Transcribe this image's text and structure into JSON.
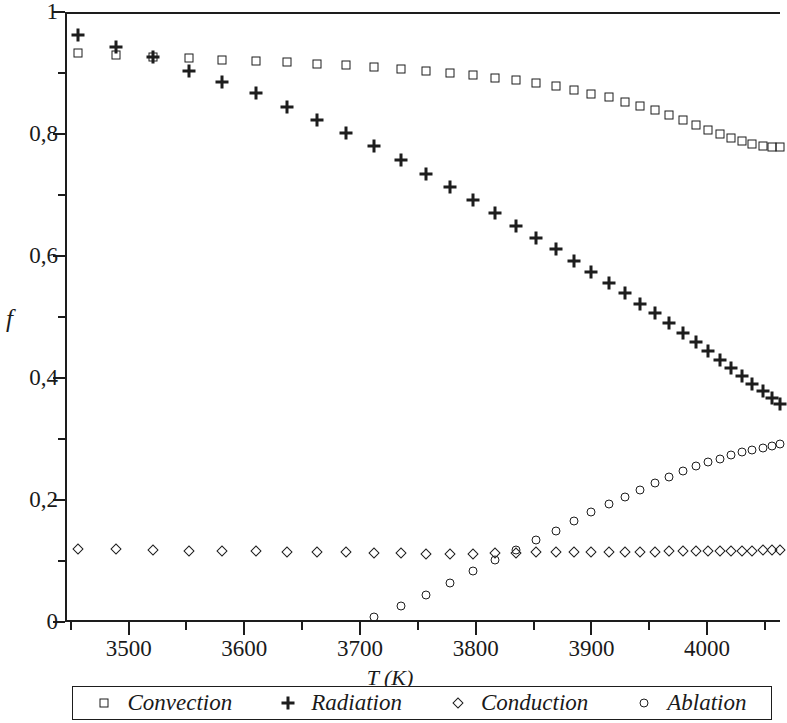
{
  "axes": {
    "y_title": "f",
    "x_title": "T (K)",
    "y_major_labels": [
      "1",
      "0,8",
      "0,6",
      "0,4",
      "0,2",
      "0"
    ],
    "y_major_values": [
      1,
      0.8,
      0.6,
      0.4,
      0.2,
      0
    ],
    "y_minor_values": [
      0.9,
      0.7,
      0.5,
      0.3,
      0.1
    ],
    "x_major_labels": [
      "3500",
      "3600",
      "3700",
      "3800",
      "3900",
      "4000"
    ],
    "x_major_values": [
      3500,
      3600,
      3700,
      3800,
      3900,
      4000
    ],
    "x_minor_values": [
      3450,
      3550,
      3650,
      3750,
      3850,
      3950,
      4050
    ]
  },
  "legend": {
    "items": [
      {
        "label": "Convection",
        "marker": "square-icon"
      },
      {
        "label": "Radiation",
        "marker": "plus-icon"
      },
      {
        "label": "Conduction",
        "marker": "diamond-icon"
      },
      {
        "label": "Ablation",
        "marker": "circle-icon"
      }
    ]
  },
  "chart_data": {
    "type": "scatter",
    "title": "",
    "xlabel": "T (K)",
    "ylabel": "f",
    "xlim": [
      3445,
      4063
    ],
    "ylim": [
      0,
      1
    ],
    "grid": false,
    "legend_position": "bottom",
    "marker_colors": {
      "all": "#1d1d1d"
    },
    "series": [
      {
        "name": "Convection",
        "marker": "square",
        "x": [
          3456,
          3489,
          3521,
          3552,
          3581,
          3610,
          3637,
          3663,
          3688,
          3712,
          3735,
          3757,
          3778,
          3798,
          3817,
          3835,
          3852,
          3869,
          3885,
          3900,
          3915,
          3929,
          3942,
          3955,
          3967,
          3979,
          3990,
          4001,
          4011,
          4021,
          4030,
          4039,
          4048,
          4056,
          4063
        ],
        "y": [
          0.932,
          0.929,
          0.927,
          0.924,
          0.922,
          0.92,
          0.918,
          0.915,
          0.913,
          0.91,
          0.907,
          0.904,
          0.9,
          0.896,
          0.892,
          0.888,
          0.883,
          0.878,
          0.872,
          0.866,
          0.86,
          0.853,
          0.846,
          0.839,
          0.831,
          0.823,
          0.815,
          0.807,
          0.8,
          0.793,
          0.788,
          0.784,
          0.781,
          0.779,
          0.778
        ]
      },
      {
        "name": "Radiation",
        "marker": "plus",
        "x": [
          3456,
          3489,
          3521,
          3552,
          3581,
          3610,
          3637,
          3663,
          3688,
          3712,
          3735,
          3757,
          3778,
          3798,
          3817,
          3835,
          3852,
          3869,
          3885,
          3900,
          3915,
          3929,
          3942,
          3955,
          3967,
          3979,
          3990,
          4001,
          4011,
          4021,
          4030,
          4039,
          4048,
          4056,
          4063
        ],
        "y": [
          0.963,
          0.942,
          0.926,
          0.904,
          0.885,
          0.867,
          0.845,
          0.823,
          0.801,
          0.78,
          0.757,
          0.735,
          0.713,
          0.691,
          0.67,
          0.65,
          0.63,
          0.611,
          0.592,
          0.574,
          0.556,
          0.539,
          0.522,
          0.506,
          0.49,
          0.474,
          0.459,
          0.444,
          0.43,
          0.416,
          0.403,
          0.39,
          0.378,
          0.367,
          0.357
        ]
      },
      {
        "name": "Conduction",
        "marker": "diamond",
        "x": [
          3456,
          3489,
          3521,
          3552,
          3581,
          3610,
          3637,
          3663,
          3688,
          3712,
          3735,
          3757,
          3778,
          3798,
          3817,
          3835,
          3852,
          3869,
          3885,
          3900,
          3915,
          3929,
          3942,
          3955,
          3967,
          3979,
          3990,
          4001,
          4011,
          4021,
          4030,
          4039,
          4048,
          4056,
          4063
        ],
        "y": [
          0.119,
          0.119,
          0.118,
          0.117,
          0.116,
          0.116,
          0.115,
          0.114,
          0.114,
          0.113,
          0.113,
          0.112,
          0.112,
          0.112,
          0.113,
          0.113,
          0.114,
          0.114,
          0.114,
          0.115,
          0.115,
          0.115,
          0.115,
          0.115,
          0.116,
          0.116,
          0.116,
          0.116,
          0.117,
          0.117,
          0.117,
          0.117,
          0.118,
          0.118,
          0.118
        ]
      },
      {
        "name": "Ablation",
        "marker": "circle",
        "x": [
          3712,
          3735,
          3757,
          3778,
          3798,
          3817,
          3835,
          3852,
          3869,
          3885,
          3900,
          3915,
          3929,
          3942,
          3955,
          3967,
          3979,
          3990,
          4001,
          4011,
          4021,
          4030,
          4039,
          4048,
          4056,
          4063
        ],
        "y": [
          0.008,
          0.026,
          0.045,
          0.064,
          0.083,
          0.101,
          0.118,
          0.134,
          0.15,
          0.165,
          0.18,
          0.193,
          0.205,
          0.217,
          0.228,
          0.238,
          0.247,
          0.255,
          0.262,
          0.268,
          0.273,
          0.278,
          0.282,
          0.286,
          0.289,
          0.291
        ]
      }
    ]
  }
}
